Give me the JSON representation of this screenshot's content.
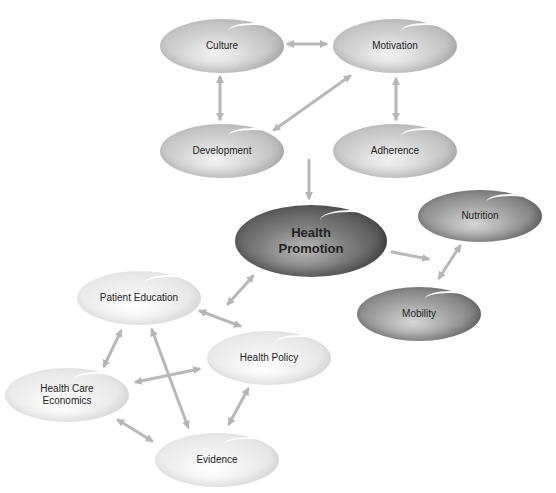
{
  "diagram": {
    "nodes": {
      "culture": {
        "label": "Culture"
      },
      "motivation": {
        "label": "Motivation"
      },
      "development": {
        "label": "Development"
      },
      "adherence": {
        "label": "Adherence"
      },
      "health_promotion": {
        "label_line1": "Health",
        "label_line2": "Promotion"
      },
      "nutrition": {
        "label": "Nutrition"
      },
      "mobility": {
        "label": "Mobility"
      },
      "patient_education": {
        "label": "Patient Education"
      },
      "health_policy": {
        "label": "Health Policy"
      },
      "health_care_economics": {
        "label_line1": "Health Care",
        "label_line2": "Economics"
      },
      "evidence": {
        "label": "Evidence"
      }
    },
    "edges": [
      {
        "from": "Culture",
        "to": "Motivation",
        "type": "bidirectional"
      },
      {
        "from": "Culture",
        "to": "Development",
        "type": "bidirectional"
      },
      {
        "from": "Development",
        "to": "Motivation",
        "type": "bidirectional"
      },
      {
        "from": "Motivation",
        "to": "Adherence",
        "type": "bidirectional"
      },
      {
        "from": "Development",
        "to": "Health Promotion",
        "type": "directed"
      },
      {
        "from": "Health Promotion",
        "to": "Nutrition/Mobility",
        "type": "directed"
      },
      {
        "from": "Nutrition",
        "to": "Mobility",
        "type": "bidirectional"
      },
      {
        "from": "Health Promotion",
        "to": "Patient Education",
        "type": "bidirectional"
      },
      {
        "from": "Patient Education",
        "to": "Health Policy",
        "type": "bidirectional"
      },
      {
        "from": "Patient Education",
        "to": "Health Care Economics",
        "type": "bidirectional"
      },
      {
        "from": "Patient Education",
        "to": "Evidence",
        "type": "bidirectional"
      },
      {
        "from": "Health Care Economics",
        "to": "Health Policy",
        "type": "bidirectional"
      },
      {
        "from": "Health Care Economics",
        "to": "Evidence",
        "type": "bidirectional"
      },
      {
        "from": "Health Policy",
        "to": "Evidence",
        "type": "bidirectional"
      }
    ],
    "colors": {
      "arrow": "#b5b5b5",
      "light_node": "#e6e6e6",
      "mid_node": "#c4c4c4",
      "dark_node": "#8f8f8f",
      "darkest_node": "#5e5e5e"
    }
  }
}
